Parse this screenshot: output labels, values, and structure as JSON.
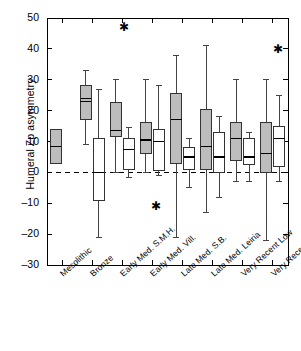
{
  "chart_data": {
    "type": "box",
    "title": "",
    "xlabel": "",
    "ylabel": "Humeral Zp asymmetry",
    "ylim": [
      -30,
      50
    ],
    "yticks": [
      -30,
      -20,
      -10,
      0,
      10,
      20,
      30,
      40,
      50
    ],
    "ytick_labels": [
      "–30",
      "–20",
      "–10",
      "0",
      "10",
      "20",
      "30",
      "40",
      "50"
    ],
    "grid": false,
    "legend": null,
    "reference_line": {
      "y": 0,
      "style": "dashed"
    },
    "categories": [
      "Mesolithic",
      "Bronze",
      "Early Med. S.M.H.",
      "Early Med. Vill.",
      "Late Med. S.B.",
      "Late Med. Leiria",
      "Very Recent Low",
      "Very Recent High"
    ],
    "series": [
      {
        "name": "Males",
        "fill": "#bdbdbd",
        "boxes": [
          {
            "category": "Mesolithic",
            "whisker_low": 3.0,
            "q1": 3.0,
            "median": 8.5,
            "q3": 14.0,
            "whisker_high": 14.0
          },
          {
            "category": "Bronze",
            "whisker_low": 9.0,
            "q1": 17.0,
            "median": 23.0,
            "q3": 28.0,
            "whisker_high": 33.0
          },
          {
            "category": "Early Med. S.M.H.",
            "whisker_low": 0.0,
            "q1": 11.5,
            "median": 13.5,
            "q3": 22.5,
            "whisker_high": 30.0
          },
          {
            "category": "Early Med. Vill.",
            "whisker_low": 0.0,
            "q1": 6.0,
            "median": 10.5,
            "q3": 16.0,
            "whisker_high": 30.0
          },
          {
            "category": "Late Med. S.B.",
            "whisker_low": -21.0,
            "q1": 3.0,
            "median": 17.0,
            "q3": 25.5,
            "whisker_high": 38.0
          },
          {
            "category": "Late Med. Leiria",
            "whisker_low": -13.0,
            "q1": 1.0,
            "median": 8.5,
            "q3": 20.5,
            "whisker_high": 41.0
          },
          {
            "category": "Very Recent Low",
            "whisker_low": -3.0,
            "q1": 4.0,
            "median": 11.0,
            "q3": 16.0,
            "whisker_high": 30.0
          },
          {
            "category": "Very Recent High",
            "whisker_low": -22.0,
            "q1": 0.0,
            "median": 6.0,
            "q3": 16.0,
            "whisker_high": 30.0
          }
        ]
      },
      {
        "name": "Females",
        "fill": "#ffffff",
        "boxes": [
          {
            "category": "Bronze",
            "whisker_low": -21.0,
            "q1": -9.0,
            "median": 0.0,
            "q3": 11.0,
            "whisker_high": 27.0
          },
          {
            "category": "Early Med. S.M.H.",
            "whisker_low": -1.5,
            "q1": 1.0,
            "median": 7.5,
            "q3": 11.0,
            "whisker_high": 14.5
          },
          {
            "category": "Early Med. Vill.",
            "whisker_low": -1.0,
            "q1": 0.5,
            "median": 10.0,
            "q3": 14.0,
            "whisker_high": 28.0
          },
          {
            "category": "Late Med. S.B.",
            "whisker_low": -5.0,
            "q1": 1.0,
            "median": 5.0,
            "q3": 8.0,
            "whisker_high": 11.0
          },
          {
            "category": "Late Med. Leiria",
            "whisker_low": -8.0,
            "q1": 0.0,
            "median": 5.0,
            "q3": 13.0,
            "whisker_high": 18.0
          },
          {
            "category": "Very Recent Low",
            "whisker_low": -3.0,
            "q1": 2.5,
            "median": 5.0,
            "q3": 11.0,
            "whisker_high": 13.0
          },
          {
            "category": "Very Recent High",
            "whisker_low": -3.0,
            "q1": 2.0,
            "median": 11.0,
            "q3": 15.0,
            "whisker_high": 25.0
          }
        ]
      }
    ],
    "single_marks": [
      {
        "category": "Bronze",
        "y": 24.0,
        "note": "short horizontal dash (small sample)"
      }
    ],
    "outliers": [
      {
        "category": "Early Med. S.M.H.",
        "y": 47.0,
        "marker": "asterisk"
      },
      {
        "category": "Early Med. Vill.",
        "y": -11.0,
        "marker": "asterisk"
      },
      {
        "category": "Very Recent High",
        "y": 40.0,
        "marker": "asterisk"
      }
    ]
  }
}
